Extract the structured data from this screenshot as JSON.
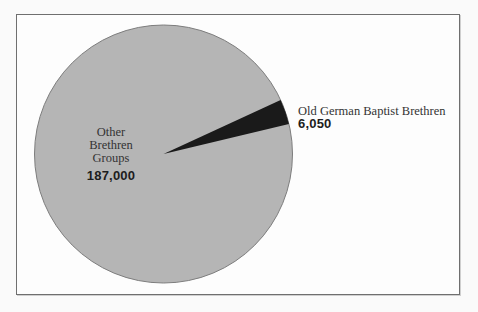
{
  "chart_data": {
    "type": "pie",
    "title": "",
    "total": 193050,
    "slices": [
      {
        "name": "Other Brethren Groups",
        "label_lines": [
          "Other",
          "Brethren",
          "Groups"
        ],
        "value": 187000,
        "value_text": "187,000",
        "color": "#b5b5b5",
        "label_position": "inside"
      },
      {
        "name": "Old German Baptist Brethren",
        "label_lines": [
          "Old German Baptist Brethren"
        ],
        "value": 6050,
        "value_text": "6,050",
        "color": "#1a1a1a",
        "label_position": "outside-right"
      }
    ],
    "start_angle_deg": 13.5,
    "legend_position": "none",
    "outline_color": "#7d7d7d",
    "frame_border_color": "#6f6f6f",
    "background_color": "#fdfdfd",
    "text_color": "#333333"
  }
}
